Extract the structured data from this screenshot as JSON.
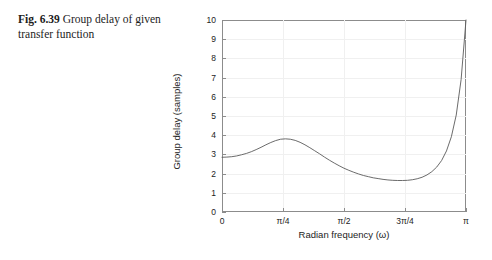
{
  "caption": {
    "figure_label": "Fig. 6.39",
    "figure_text": "Group delay of given transfer function"
  },
  "chart_data": {
    "type": "line",
    "title": "",
    "xlabel": "Radian frequency (ω)",
    "ylabel": "Group delay (samples)",
    "xlim": [
      0,
      3.14159265
    ],
    "ylim": [
      0,
      10
    ],
    "grid": true,
    "legend": null,
    "x_tick_labels": [
      "0",
      "π/4",
      "π/2",
      "3π/4",
      "π"
    ],
    "x_tick_values": [
      0,
      0.78539816,
      1.57079633,
      2.35619449,
      3.14159265
    ],
    "y_tick_labels": [
      "0",
      "1",
      "2",
      "3",
      "4",
      "5",
      "6",
      "7",
      "8",
      "9",
      "10"
    ],
    "y_tick_values": [
      0,
      1,
      2,
      3,
      4,
      5,
      6,
      7,
      8,
      9,
      10
    ],
    "series": [
      {
        "name": "Group delay",
        "color": "#5a5a5a",
        "x": [
          0.0,
          0.0628,
          0.1257,
          0.1885,
          0.2513,
          0.3142,
          0.377,
          0.4398,
          0.5027,
          0.5655,
          0.6283,
          0.6912,
          0.754,
          0.8168,
          0.8796,
          0.9425,
          1.0053,
          1.0681,
          1.131,
          1.1938,
          1.2566,
          1.3195,
          1.3823,
          1.4451,
          1.508,
          1.5708,
          1.6336,
          1.6965,
          1.7593,
          1.8221,
          1.885,
          1.9478,
          2.0106,
          2.0735,
          2.1363,
          2.1991,
          2.2619,
          2.3248,
          2.3876,
          2.4504,
          2.5133,
          2.5761,
          2.6389,
          2.7018,
          2.7646,
          2.8274,
          2.8903,
          2.9531,
          3.0159,
          3.0788,
          3.1416
        ],
        "y": [
          2.85,
          2.86,
          2.88,
          2.92,
          2.98,
          3.05,
          3.14,
          3.25,
          3.37,
          3.5,
          3.62,
          3.72,
          3.79,
          3.81,
          3.79,
          3.73,
          3.63,
          3.5,
          3.35,
          3.19,
          3.03,
          2.86,
          2.7,
          2.55,
          2.41,
          2.28,
          2.17,
          2.07,
          1.98,
          1.9,
          1.84,
          1.78,
          1.74,
          1.7,
          1.67,
          1.65,
          1.64,
          1.64,
          1.65,
          1.68,
          1.73,
          1.81,
          1.93,
          2.1,
          2.34,
          2.68,
          3.18,
          3.92,
          5.05,
          6.9,
          10.0
        ]
      }
    ],
    "annotations": {
      "start_value": 2.85,
      "local_max_value": 3.81,
      "local_max_x_label": "π/4",
      "local_min_value": 1.64,
      "end_value": 10.0
    }
  }
}
